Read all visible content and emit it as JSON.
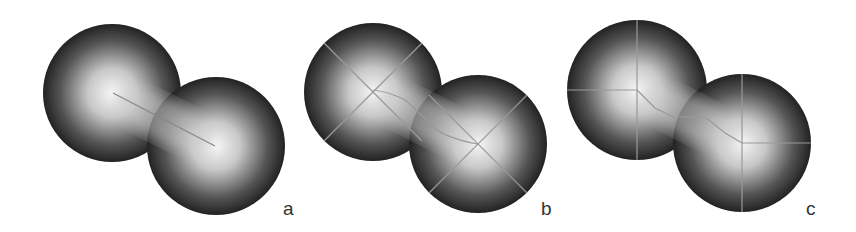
{
  "figure": {
    "panels": [
      {
        "label": "a",
        "description": "Two overlapping spheres with straight medial line between centers"
      },
      {
        "label": "b",
        "description": "Two overlapping spheres with diagonal cross lines and curved path"
      },
      {
        "label": "c",
        "description": "Two overlapping spheres with axis-aligned cross lines and stepped path"
      }
    ]
  }
}
